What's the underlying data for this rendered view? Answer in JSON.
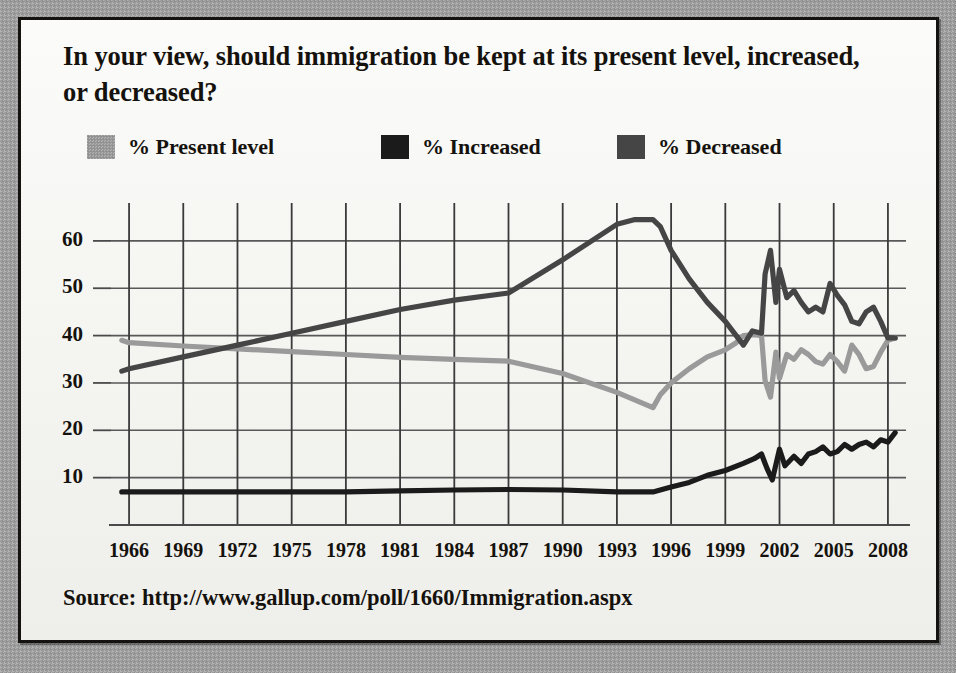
{
  "title": "In your view, should immigration be kept at its present level, increased, or decreased?",
  "source": "Source: http://www.gallup.com/poll/1660/Immigration.aspx",
  "legend": [
    {
      "label": "% Present level",
      "color": "#9a9a9a",
      "x": 0
    },
    {
      "label": "% Increased",
      "color": "#1b1b1b",
      "x": 294
    },
    {
      "label": "% Decreased",
      "color": "#454545",
      "x": 530
    }
  ],
  "chart_data": {
    "type": "line",
    "title": "In your view, should immigration be kept at its present level, increased, or decreased?",
    "xlabel": "",
    "ylabel": "",
    "xlim": [
      1965,
      2009
    ],
    "ylim": [
      0,
      68
    ],
    "grid": true,
    "legend_position": "top",
    "y_ticks": [
      10,
      20,
      30,
      40,
      50,
      60
    ],
    "x_ticks": [
      1966,
      1969,
      1972,
      1975,
      1978,
      1981,
      1984,
      1987,
      1990,
      1993,
      1996,
      1999,
      2002,
      2005,
      2008
    ],
    "series": [
      {
        "name": "% Present level",
        "color": "#9a9a9a",
        "points": [
          [
            1965.6,
            39
          ],
          [
            1966,
            38.5
          ],
          [
            1969,
            37.8
          ],
          [
            1972,
            37.2
          ],
          [
            1975,
            36.6
          ],
          [
            1978,
            36.0
          ],
          [
            1981,
            35.4
          ],
          [
            1984,
            35.0
          ],
          [
            1987,
            34.6
          ],
          [
            1990,
            32.0
          ],
          [
            1993,
            28.0
          ],
          [
            1995,
            24.8
          ],
          [
            1995.4,
            27.5
          ],
          [
            1996,
            30.0
          ],
          [
            1997,
            33.0
          ],
          [
            1998,
            35.5
          ],
          [
            1999,
            37.0
          ],
          [
            1999.6,
            38.5
          ],
          [
            2000,
            40.0
          ],
          [
            2000.6,
            40.2
          ],
          [
            2001,
            40.0
          ],
          [
            2001.2,
            30.5
          ],
          [
            2001.5,
            27.0
          ],
          [
            2001.8,
            36.5
          ],
          [
            2002,
            31.0
          ],
          [
            2002.4,
            36.0
          ],
          [
            2002.8,
            35.0
          ],
          [
            2003.2,
            37.0
          ],
          [
            2003.6,
            36.0
          ],
          [
            2004,
            34.5
          ],
          [
            2004.4,
            34.0
          ],
          [
            2004.8,
            36.0
          ],
          [
            2005.2,
            34.5
          ],
          [
            2005.6,
            32.5
          ],
          [
            2006,
            38.0
          ],
          [
            2006.4,
            36.0
          ],
          [
            2006.8,
            33.0
          ],
          [
            2007.2,
            33.5
          ],
          [
            2007.6,
            36.5
          ],
          [
            2008,
            39.0
          ],
          [
            2008.4,
            39.5
          ]
        ]
      },
      {
        "name": "% Increased",
        "color": "#1b1b1b",
        "points": [
          [
            1965.6,
            7
          ],
          [
            1966,
            7
          ],
          [
            1969,
            7
          ],
          [
            1972,
            7
          ],
          [
            1975,
            7
          ],
          [
            1978,
            7
          ],
          [
            1981,
            7.2
          ],
          [
            1984,
            7.4
          ],
          [
            1987,
            7.5
          ],
          [
            1990,
            7.4
          ],
          [
            1993,
            7.0
          ],
          [
            1995,
            7.0
          ],
          [
            1996,
            8.0
          ],
          [
            1997,
            9.0
          ],
          [
            1998,
            10.5
          ],
          [
            1999,
            11.5
          ],
          [
            2000,
            13.0
          ],
          [
            2000.6,
            14.0
          ],
          [
            2001,
            15.0
          ],
          [
            2001.3,
            12.0
          ],
          [
            2001.6,
            9.5
          ],
          [
            2002,
            16.0
          ],
          [
            2002.3,
            12.5
          ],
          [
            2002.8,
            14.5
          ],
          [
            2003.2,
            13.0
          ],
          [
            2003.6,
            15.0
          ],
          [
            2004,
            15.5
          ],
          [
            2004.4,
            16.5
          ],
          [
            2004.8,
            15.0
          ],
          [
            2005.2,
            15.5
          ],
          [
            2005.6,
            17.0
          ],
          [
            2006,
            16.0
          ],
          [
            2006.4,
            17.0
          ],
          [
            2006.8,
            17.5
          ],
          [
            2007.2,
            16.5
          ],
          [
            2007.6,
            18.0
          ],
          [
            2008,
            17.5
          ],
          [
            2008.4,
            19.5
          ]
        ]
      },
      {
        "name": "% Decreased",
        "color": "#454545",
        "points": [
          [
            1965.6,
            32.5
          ],
          [
            1966,
            33.0
          ],
          [
            1969,
            35.5
          ],
          [
            1972,
            38.0
          ],
          [
            1975,
            40.5
          ],
          [
            1978,
            43.0
          ],
          [
            1981,
            45.5
          ],
          [
            1984,
            47.5
          ],
          [
            1987,
            49.0
          ],
          [
            1990,
            56.0
          ],
          [
            1993,
            63.5
          ],
          [
            1994,
            64.5
          ],
          [
            1995,
            64.5
          ],
          [
            1995.4,
            63.0
          ],
          [
            1996,
            58.0
          ],
          [
            1997,
            52.0
          ],
          [
            1998,
            47.0
          ],
          [
            1999,
            43.0
          ],
          [
            1999.6,
            40.0
          ],
          [
            2000,
            38.0
          ],
          [
            2000.5,
            41.0
          ],
          [
            2001,
            40.5
          ],
          [
            2001.2,
            53.0
          ],
          [
            2001.5,
            58.0
          ],
          [
            2001.8,
            47.0
          ],
          [
            2002,
            54.0
          ],
          [
            2002.4,
            48.0
          ],
          [
            2002.8,
            49.5
          ],
          [
            2003.2,
            47.0
          ],
          [
            2003.6,
            45.0
          ],
          [
            2004,
            46.0
          ],
          [
            2004.4,
            45.0
          ],
          [
            2004.8,
            51.0
          ],
          [
            2005.2,
            48.5
          ],
          [
            2005.6,
            46.5
          ],
          [
            2006,
            43.0
          ],
          [
            2006.4,
            42.5
          ],
          [
            2006.8,
            45.0
          ],
          [
            2007.2,
            46.0
          ],
          [
            2007.6,
            43.0
          ],
          [
            2008,
            39.5
          ],
          [
            2008.4,
            39.5
          ]
        ]
      }
    ]
  }
}
